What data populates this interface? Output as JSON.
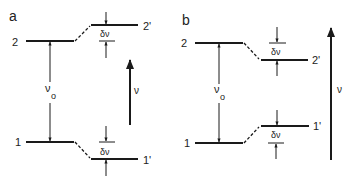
{
  "panels": [
    {
      "id": "a",
      "label": "a",
      "upper_level": {
        "left_label": "2",
        "right_label": "2'"
      },
      "lower_level": {
        "left_label": "1",
        "right_label": "1'"
      },
      "shift_upper": "δν",
      "shift_lower": "δν",
      "transition_label": "ν",
      "transition_sub": "o",
      "frequency_label": "ν",
      "description": "Upper level shifts up, lower level shifts down"
    },
    {
      "id": "b",
      "label": "b",
      "upper_level": {
        "left_label": "2",
        "right_label": "2'"
      },
      "lower_level": {
        "left_label": "1",
        "right_label": "1'"
      },
      "shift_upper": "δν",
      "shift_lower": "δν",
      "transition_label": "ν",
      "transition_sub": "o",
      "frequency_label": "ν",
      "description": "Upper level shifts down, lower level shifts up"
    }
  ],
  "colors": {
    "line": "#1a1a1a",
    "text": "#222222",
    "background": "#ffffff"
  }
}
